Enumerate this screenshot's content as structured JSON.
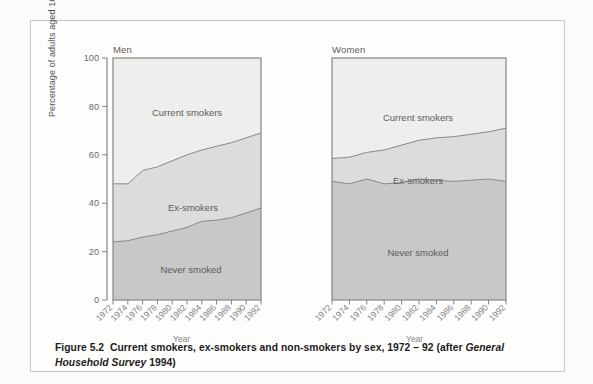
{
  "figure": {
    "caption_prefix": "Figure 5.2",
    "caption_main": "Current smokers, ex-smokers and non-smokers by sex, 1972 – 92 (after ",
    "caption_italic": "General Household Survey",
    "caption_suffix": " 1994)"
  },
  "axis": {
    "ylabel": "Percentage of adults aged 16 or over",
    "xlabel_men": "Year",
    "xlabel_women": "Year",
    "yticks": [
      "0",
      "20",
      "40",
      "60",
      "80",
      "100"
    ],
    "xticks": [
      "1972",
      "1974",
      "1976",
      "1978",
      "1980",
      "1982",
      "1984",
      "1986",
      "1988",
      "1990",
      "1992"
    ]
  },
  "panels": {
    "men_title": "Men",
    "women_title": "Women"
  },
  "series_labels": {
    "current": "Current smokers",
    "ex": "Ex-smokers",
    "never": "Never smoked"
  },
  "colors": {
    "never_fill": "#c8c8c6",
    "ex_fill": "#dcdcda",
    "current_fill": "#eeeeec",
    "line": "#8e8c88",
    "axis": "#7d7b77",
    "text": "#5e5c59",
    "page": "#fdfdfc"
  },
  "chart_data": {
    "type": "area",
    "title": "Current smokers, ex-smokers and non-smokers by sex, 1972 – 92",
    "xlabel": "Year",
    "ylabel": "Percentage of adults aged 16 or over",
    "ylim": [
      0,
      100
    ],
    "xlim": [
      1972,
      1992
    ],
    "grid": false,
    "legend": "inline-area-labels",
    "stacked": true,
    "x": [
      1972,
      1974,
      1976,
      1978,
      1980,
      1982,
      1984,
      1986,
      1988,
      1990,
      1992
    ],
    "panels": [
      {
        "name": "Men",
        "series": [
          {
            "name": "Never smoked",
            "values": [
              24,
              24.5,
              26,
              27,
              28.5,
              30,
              32.5,
              33,
              34,
              36,
              38
            ]
          },
          {
            "name": "Ex-smokers",
            "values": [
              24,
              23.5,
              27.5,
              28,
              29,
              30,
              29.5,
              30.5,
              31,
              31,
              31
            ]
          },
          {
            "name": "Current smokers",
            "values": [
              52,
              52,
              46.5,
              45,
              42.5,
              40,
              38,
              36.5,
              35,
              33,
              31
            ]
          }
        ],
        "cumulative_boundaries": {
          "never_smoked_top": [
            24,
            24.5,
            26,
            27,
            28.5,
            30,
            32.5,
            33,
            34,
            36,
            38
          ],
          "ex_smokers_top": [
            48,
            48,
            53.5,
            55,
            57.5,
            60,
            62,
            63.5,
            65,
            67,
            69
          ]
        }
      },
      {
        "name": "Women",
        "series": [
          {
            "name": "Never smoked",
            "values": [
              49,
              48,
              50,
              48,
              48.5,
              50,
              49.5,
              49,
              49.5,
              50,
              49
            ]
          },
          {
            "name": "Ex-smokers",
            "values": [
              9.5,
              11,
              11,
              14,
              15.5,
              16,
              17.5,
              18.5,
              19,
              19.5,
              22
            ]
          },
          {
            "name": "Current smokers",
            "values": [
              41.5,
              41,
              39,
              38,
              36,
              34,
              33,
              32.5,
              31.5,
              30.5,
              29
            ]
          }
        ],
        "cumulative_boundaries": {
          "never_smoked_top": [
            49,
            48,
            50,
            48,
            48.5,
            50,
            49.5,
            49,
            49.5,
            50,
            49
          ],
          "ex_smokers_top": [
            58.5,
            59,
            61,
            62,
            64,
            66,
            67,
            67.5,
            68.5,
            69.5,
            71
          ]
        }
      }
    ]
  }
}
